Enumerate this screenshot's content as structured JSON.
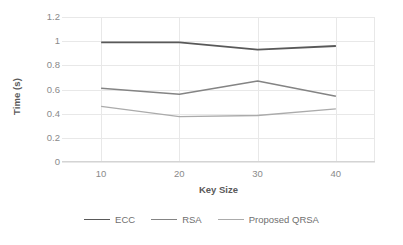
{
  "chart_data": {
    "type": "line",
    "title": "",
    "xlabel": "Key Size",
    "ylabel": "Time (s)",
    "categories": [
      10,
      20,
      30,
      40
    ],
    "x_tick_labels": [
      "10",
      "20",
      "30",
      "40"
    ],
    "y_tick_labels": [
      "1.2",
      "1",
      "0.8",
      "0.6",
      "0.4",
      "0.2",
      "0"
    ],
    "y_ticks": [
      1.2,
      1,
      0.8,
      0.6,
      0.4,
      0.2,
      0
    ],
    "xlim": [
      5,
      45
    ],
    "ylim": [
      0,
      1.2
    ],
    "grid": "horizontal-and-vertical",
    "legend_position": "bottom",
    "series": [
      {
        "name": "ECC",
        "values": [
          0.99,
          0.99,
          0.93,
          0.96
        ],
        "color": "#595959",
        "width": 1.8
      },
      {
        "name": "RSA",
        "values": [
          0.61,
          0.56,
          0.67,
          0.545
        ],
        "color": "#848484",
        "width": 1.5
      },
      {
        "name": "Proposed QRSA",
        "values": [
          0.46,
          0.375,
          0.385,
          0.44
        ],
        "color": "#ababab",
        "width": 1.3
      }
    ]
  },
  "axes": {
    "y_title": "Time (s)",
    "x_title": "Key Size",
    "y_labels": [
      "1.2",
      "1",
      "0.8",
      "0.6",
      "0.4",
      "0.2",
      "0"
    ],
    "x_labels": [
      "10",
      "20",
      "30",
      "40"
    ]
  },
  "legend": {
    "items": [
      {
        "label": "ECC",
        "color": "#595959"
      },
      {
        "label": "RSA",
        "color": "#848484"
      },
      {
        "label": "Proposed QRSA",
        "color": "#ababab"
      }
    ]
  },
  "colors": {
    "background": "#ffffff",
    "gridline": "#e8e8e8",
    "axis": "#d4d4d4",
    "tick_text": "#8a8a8a",
    "title_text": "#5a5a5a"
  }
}
